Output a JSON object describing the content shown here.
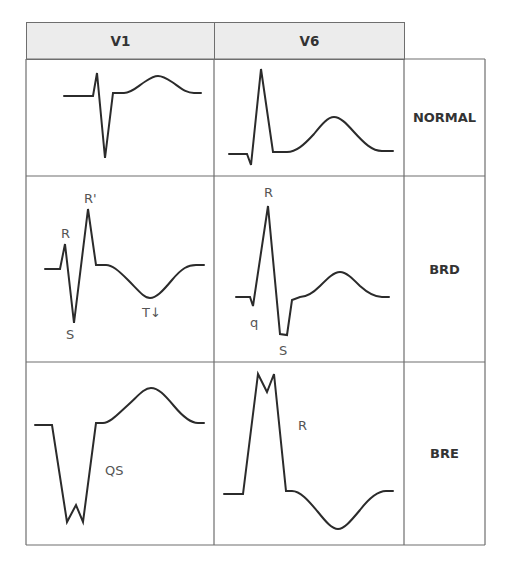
{
  "table": {
    "columns": [
      "V1",
      "V6"
    ],
    "rows": [
      {
        "label": "NORMAL"
      },
      {
        "label": "BRD"
      },
      {
        "label": "BRE"
      }
    ]
  },
  "annotations": {
    "brd_v1": {
      "r": "R",
      "r_prime": "R'",
      "s": "S",
      "t": "T↓"
    },
    "brd_v6": {
      "r": "R",
      "q": "q",
      "s": "S"
    },
    "bre_v1": {
      "qs": "QS"
    },
    "bre_v6": {
      "r": "R"
    }
  },
  "colors": {
    "header_bg": "#ececec",
    "grid_line": "#6e6e6e",
    "trace": "#2b2b2b"
  }
}
